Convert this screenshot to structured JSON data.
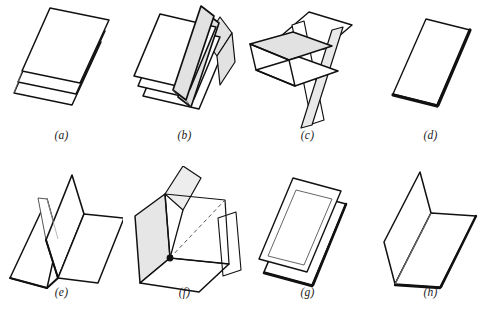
{
  "plate": {
    "title": "Plane figure plate",
    "background_color": "#ffffff",
    "stroke_color": "#111111",
    "thin_stroke_color": "#3a3a3a",
    "shade_color": "#e2e2e2",
    "width": 492,
    "height": 327
  },
  "figures": [
    {
      "id": "a",
      "caption": "(a)",
      "name": "three-stacked-parallel-sheets",
      "description": "Three identical flat rectangular sheets stacked in parallel and offset diagonally, drawn in outline only with no shading.",
      "shaded": false,
      "sheet_count": 3
    },
    {
      "id": "b",
      "caption": "(b)",
      "name": "three-sheets-with-upright-shaded-folds",
      "description": "Three parallel sheets each with a tall shaded flap folded upright along the long axis.",
      "shaded": true,
      "sheet_count": 3
    },
    {
      "id": "c",
      "caption": "(c)",
      "name": "intersecting-planes-with-shaded-plane",
      "description": "Several planes crossing one another; one horizontal plane is shaded grey and a vertical plane passes through it.",
      "shaded": true,
      "sheet_count": 4
    },
    {
      "id": "d",
      "caption": "(d)",
      "name": "single-flat-sheet",
      "description": "A single flat rectangular sheet in perspective with thickened lower and right edges.",
      "shaded": false,
      "sheet_count": 1
    },
    {
      "id": "e",
      "caption": "(e)",
      "name": "w-fold-sheet",
      "description": "A sheet folded into a W / valley shape with two upright panels and two base panels.",
      "shaded": false,
      "sheet_count": 1
    },
    {
      "id": "f",
      "caption": "(f)",
      "name": "three-mutually-perpendicular-planes",
      "description": "Three mutually perpendicular planes meeting at a common point marked with a solid black dot; the left vertical plane is shaded.",
      "shaded": true,
      "sheet_count": 3,
      "marker": "intersection-dot"
    },
    {
      "id": "g",
      "caption": "(g)",
      "name": "two-stacked-sheets",
      "description": "Two identical flat sheets stacked with a small diagonal offset, outline only.",
      "shaded": false,
      "sheet_count": 2
    },
    {
      "id": "h",
      "caption": "(h)",
      "name": "l-fold-sheet",
      "description": "A sheet folded once at a right angle forming an L, one upright panel and one horizontal panel.",
      "shaded": false,
      "sheet_count": 1
    }
  ]
}
